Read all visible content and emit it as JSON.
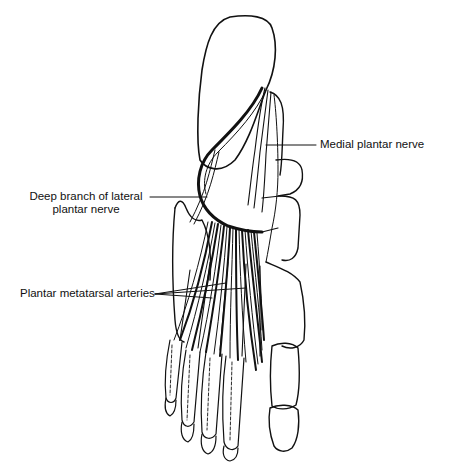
{
  "diagram": {
    "colors": {
      "line": "#111111",
      "background": "#ffffff"
    },
    "labels": [
      {
        "id": "medial-plantar-nerve",
        "text": "Medial plantar nerve"
      },
      {
        "id": "deep-branch-lateral-plantar-nerve",
        "line1": "Deep branch of lateral",
        "line2": "plantar nerve"
      },
      {
        "id": "plantar-metatarsal-arteries",
        "text": "Plantar metatarsal arteries"
      }
    ]
  }
}
